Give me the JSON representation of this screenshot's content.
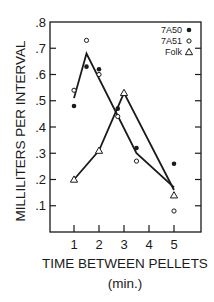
{
  "chart_data": {
    "type": "line",
    "title": "",
    "xlabel": "TIME BETWEEN PELLETS",
    "xlabel_units": "(min.)",
    "ylabel": "MILLILITERS PER INTERVAL",
    "xlim": [
      0,
      6
    ],
    "ylim": [
      0,
      0.8
    ],
    "x_ticks": [
      1,
      2,
      3,
      4,
      5
    ],
    "x_tick_labels": [
      "1",
      "2",
      "3",
      "4",
      "5"
    ],
    "y_ticks": [
      0.1,
      0.2,
      0.3,
      0.4,
      0.5,
      0.6,
      0.7,
      0.8
    ],
    "y_tick_labels": [
      ".1",
      ".2",
      ".3",
      ".4",
      ".5",
      ".6",
      ".7",
      ".8"
    ],
    "grid": false,
    "legend_position": "upper right",
    "series": [
      {
        "name": "7A50",
        "marker": "filled-circle",
        "points": [
          {
            "x": 1,
            "y": 0.48
          },
          {
            "x": 1.5,
            "y": 0.63
          },
          {
            "x": 2,
            "y": 0.62
          },
          {
            "x": 2.75,
            "y": 0.47
          },
          {
            "x": 3.5,
            "y": 0.32
          },
          {
            "x": 5,
            "y": 0.26
          }
        ]
      },
      {
        "name": "7A51",
        "marker": "open-circle",
        "points": [
          {
            "x": 1,
            "y": 0.54
          },
          {
            "x": 1.5,
            "y": 0.73
          },
          {
            "x": 2,
            "y": 0.6
          },
          {
            "x": 2.75,
            "y": 0.44
          },
          {
            "x": 3.5,
            "y": 0.27
          },
          {
            "x": 5,
            "y": 0.08
          }
        ]
      },
      {
        "name": "Folk",
        "marker": "open-triangle",
        "points": [
          {
            "x": 1,
            "y": 0.2
          },
          {
            "x": 2,
            "y": 0.31
          },
          {
            "x": 3,
            "y": 0.53
          },
          {
            "x": 5,
            "y": 0.14
          }
        ]
      }
    ],
    "fit_lines": [
      {
        "name": "7A50/7A51 fit",
        "points": [
          {
            "x": 1,
            "y": 0.51
          },
          {
            "x": 1.5,
            "y": 0.68
          },
          {
            "x": 3.5,
            "y": 0.3
          },
          {
            "x": 5,
            "y": 0.17
          }
        ]
      },
      {
        "name": "Folk fit",
        "points": [
          {
            "x": 1,
            "y": 0.2
          },
          {
            "x": 2,
            "y": 0.31
          },
          {
            "x": 3,
            "y": 0.53
          },
          {
            "x": 5,
            "y": 0.16
          }
        ]
      }
    ]
  },
  "legend": {
    "items": [
      {
        "label": "7A50",
        "marker": "filled-circle"
      },
      {
        "label": "7A51",
        "marker": "open-circle"
      },
      {
        "label": "Folk",
        "marker": "open-triangle"
      }
    ]
  },
  "axes": {
    "x_title": "TIME BETWEEN PELLETS",
    "x_units": "(min.)",
    "y_title": "MILLILITERS PER INTERVAL"
  }
}
